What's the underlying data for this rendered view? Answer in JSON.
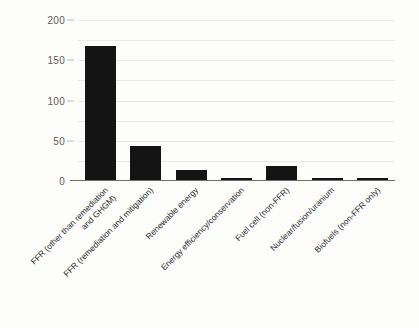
{
  "chart_data": {
    "type": "bar",
    "title": "",
    "subtitle": "",
    "xlabel": "",
    "ylabel": "",
    "ylim": [
      0,
      200
    ],
    "yticks": [
      0,
      50,
      100,
      150,
      200
    ],
    "ytick_labels": [
      "0",
      "50",
      "100",
      "150",
      "200"
    ],
    "gridlines": {
      "visible": true,
      "axis": "y",
      "interval": 25,
      "values": [
        25,
        50,
        75,
        100,
        125,
        150,
        175,
        200
      ],
      "color": "#e9e9e6"
    },
    "legend": {
      "visible": false,
      "position": "none"
    },
    "bar_color": "#141414",
    "axis_color": "#6d6d6b",
    "label_rotation": -45,
    "categories": [
      "FFR (other than remediation and GHGM)",
      "FFR (remediation and mitigation)",
      "Renewable energy",
      "Energy efficiency/conservation",
      "Fuel cell (non-FFR)",
      "Nuclear/fusion/uranium",
      "Biofuels (non-FFR only)"
    ],
    "category_lines": [
      [
        "FFR (other than remediation",
        "and GHGM)"
      ],
      [
        "FFR (remediation and mitigation)"
      ],
      [
        "Renewable energy"
      ],
      [
        "Energy efficiency/conservation"
      ],
      [
        "Fuel cell (non-FFR)"
      ],
      [
        "Nuclear/fusion/uranium"
      ],
      [
        "Biofuels (non-FFR only)"
      ]
    ],
    "values": [
      166,
      42,
      13,
      3,
      18,
      2,
      2
    ]
  }
}
